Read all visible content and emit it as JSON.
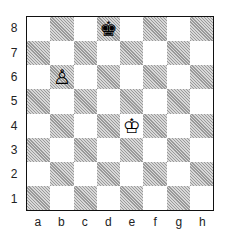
{
  "board": {
    "files": [
      "a",
      "b",
      "c",
      "d",
      "e",
      "f",
      "g",
      "h"
    ],
    "ranks": [
      "8",
      "7",
      "6",
      "5",
      "4",
      "3",
      "2",
      "1"
    ],
    "light_color": "#ffffff",
    "dark_color": "hatched-gray",
    "pieces": [
      {
        "square": "d8",
        "piece": "black-king",
        "glyph": "♚"
      },
      {
        "square": "b6",
        "piece": "white-pawn",
        "glyph": "♙"
      },
      {
        "square": "e4",
        "piece": "white-king",
        "glyph": "♔"
      }
    ]
  }
}
